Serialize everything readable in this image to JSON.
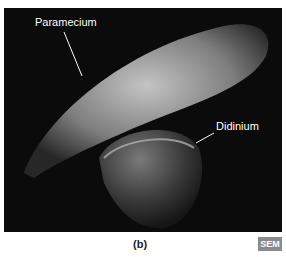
{
  "labels": {
    "paramecium": "Paramecium",
    "didinium": "Didinium"
  },
  "caption": "(b)",
  "badge": "SEM"
}
